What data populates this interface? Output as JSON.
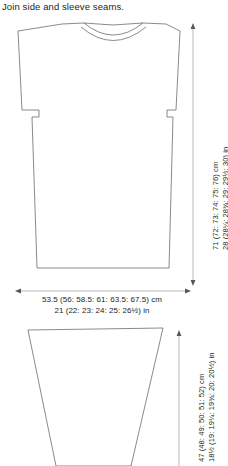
{
  "instruction": "Join side and sleeve seams.",
  "colors": {
    "outline": "#58585a",
    "dimension_line": "#8c8c8e",
    "text": "#231f20",
    "background": "#ffffff"
  },
  "schematic": {
    "type": "garment-schematic",
    "pieces": [
      {
        "name": "body",
        "shape": "drop-shoulder-tee",
        "dimensions": {
          "width": {
            "cm": "53.5 (56: 58.5: 61: 63.5: 67.5) cm",
            "in": "21 (22: 23: 24: 25: 26½) in",
            "cm_values": [
              53.5,
              56,
              58.5,
              61,
              63.5,
              67.5
            ],
            "in_values": [
              "21",
              "22",
              "23",
              "24",
              "25",
              "26½"
            ],
            "orientation": "horizontal",
            "position": "below"
          },
          "length": {
            "cm": "71 (72: 73: 74: 75: 76) cm",
            "in": "28 (28¼: 28¾: 29: 29½: 30) in",
            "cm_values": [
              71,
              72,
              73,
              74,
              75,
              76
            ],
            "in_values": [
              "28",
              "28¼",
              "28¾",
              "29",
              "29½",
              "30"
            ],
            "orientation": "vertical",
            "position": "right"
          }
        }
      },
      {
        "name": "sleeve",
        "shape": "tapered-trapezoid",
        "dimensions": {
          "length": {
            "cm": "47 (48: 49: 50: 51: 52) cm",
            "in": "18½ (19: 19¼: 19¾: 20: 20½) in",
            "cm_values": [
              47,
              48,
              49,
              50,
              51,
              52
            ],
            "in_values": [
              "18½",
              "19",
              "19¼",
              "19¾",
              "20",
              "20½"
            ],
            "orientation": "vertical",
            "position": "right"
          }
        }
      }
    ]
  },
  "labels": {
    "body_width_cm": "53.5 (56: 58.5: 61: 63.5: 67.5) cm",
    "body_width_in": "21 (22: 23: 24: 25: 26½) in",
    "body_length_cm": "71 (72: 73: 74: 75: 76) cm",
    "body_length_in": "28 (28¼: 28¾: 29: 29½: 30) in",
    "sleeve_length_cm": "47 (48: 49: 50: 51: 52) cm",
    "sleeve_length_in": "18½ (19: 19¼: 19¾: 20: 20½) in"
  }
}
